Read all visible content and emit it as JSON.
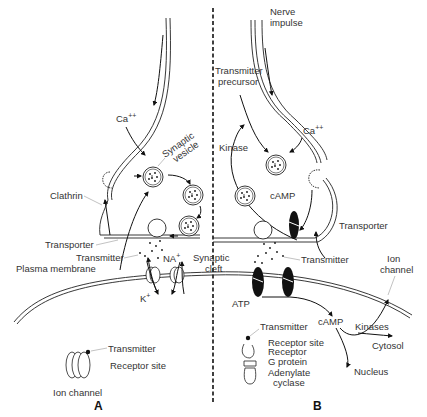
{
  "figure": {
    "panels": [
      {
        "id": "A",
        "label": "A",
        "title_labels": {
          "ca": "Ca",
          "ca_sup": "++",
          "synaptic_vesicle_1": "Synaptic",
          "synaptic_vesicle_2": "vesicle",
          "clathrin": "Clathrin",
          "transporter": "Transporter",
          "transmitter": "Transmitter",
          "plasma_membrane": "Plasma membrane",
          "na": "NA",
          "na_sup": "+",
          "k": "K",
          "k_sup": "+",
          "synaptic_cleft_1": "Synaptic",
          "synaptic_cleft_2": "cleft"
        },
        "legend": {
          "transmitter": "Transmitter",
          "receptor_site": "Receptor site",
          "ion_channel": "Ion channel"
        }
      },
      {
        "id": "B",
        "label": "B",
        "title_labels": {
          "nerve_impulse_1": "Nerve",
          "nerve_impulse_2": "impulse",
          "transmitter_precursor_1": "Transmitter",
          "transmitter_precursor_2": "precursor",
          "ca": "Ca",
          "ca_sup": "++",
          "kinase": "Kinase",
          "camp_upper": "cAMP",
          "transporter": "Transporter",
          "transmitter": "Transmitter",
          "ion_channel_1": "Ion",
          "ion_channel_2": "channel",
          "atp": "ATP",
          "camp_lower": "cAMP",
          "kinases": "Kinases",
          "cytosol": "Cytosol",
          "nucleus": "Nucleus"
        },
        "legend": {
          "transmitter": "Transmitter",
          "receptor_site": "Receptor site",
          "receptor": "Receptor",
          "g_protein": "G protein",
          "adenylate_cyclase_1": "Adenylate",
          "adenylate_cyclase_2": "cyclase"
        }
      }
    ],
    "colors": {
      "line": "#222222",
      "text": "#333333",
      "background": "#ffffff"
    }
  }
}
